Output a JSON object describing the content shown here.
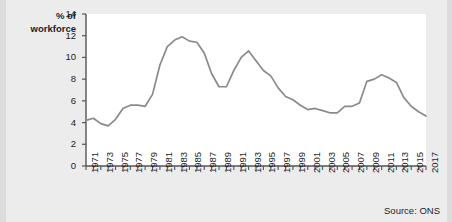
{
  "figure": {
    "background_color": "#ececed",
    "plot_background_color": "#ffffff",
    "axis_color": "#555555",
    "line_color": "#8a8a8a",
    "source_note": "Source: ONS",
    "y_axis_title_line1": "% of",
    "y_axis_title_line2": "workforce"
  },
  "chart_data": {
    "type": "line",
    "title": "",
    "subtitle": "",
    "xlabel": "",
    "ylabel": "% of workforce",
    "xlim": [
      1971,
      2017
    ],
    "ylim": [
      0,
      14
    ],
    "ytick_values": [
      0,
      2,
      4,
      6,
      8,
      10,
      12,
      14
    ],
    "ytick_labels": [
      "0",
      "2",
      "4",
      "6",
      "8",
      "10",
      "12",
      "14"
    ],
    "y_tick_interval": 2,
    "x_tick_interval_minor": 1,
    "x_tick_interval_labeled": 2,
    "xtick_labels": [
      "1971",
      "1973",
      "1975",
      "1977",
      "1979",
      "1981",
      "1983",
      "1985",
      "1987",
      "1989",
      "1991",
      "1993",
      "1995",
      "1997",
      "1999",
      "2001",
      "2003",
      "2005",
      "2007",
      "2009",
      "2011",
      "2013",
      "2015",
      "2017"
    ],
    "xtick_label_rotation": -90,
    "grid": false,
    "legend": false,
    "legend_position": "none",
    "markers": false,
    "annotations": [],
    "series": [
      {
        "name": "Unemployment rate",
        "color": "#8a8a8a",
        "x": [
          1971,
          1972,
          1973,
          1974,
          1975,
          1976,
          1977,
          1978,
          1979,
          1980,
          1981,
          1982,
          1983,
          1984,
          1985,
          1986,
          1987,
          1988,
          1989,
          1990,
          1991,
          1992,
          1993,
          1994,
          1995,
          1996,
          1997,
          1998,
          1999,
          2000,
          2001,
          2002,
          2003,
          2004,
          2005,
          2006,
          2007,
          2008,
          2009,
          2010,
          2011,
          2012,
          2013,
          2014,
          2015,
          2016,
          2017
        ],
        "values": [
          4.2,
          4.4,
          3.9,
          3.7,
          4.3,
          5.3,
          5.6,
          5.6,
          5.5,
          6.6,
          9.3,
          11.0,
          11.6,
          11.9,
          11.5,
          11.4,
          10.4,
          8.5,
          7.3,
          7.3,
          8.8,
          10.0,
          10.6,
          9.7,
          8.8,
          8.3,
          7.2,
          6.4,
          6.1,
          5.6,
          5.2,
          5.3,
          5.1,
          4.9,
          4.9,
          5.5,
          5.5,
          5.8,
          7.8,
          8.0,
          8.4,
          8.1,
          7.7,
          6.3,
          5.5,
          5.0,
          4.6
        ],
        "unit": "% of workforce"
      }
    ]
  }
}
